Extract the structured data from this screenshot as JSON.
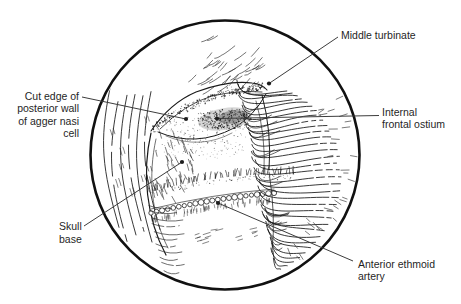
{
  "labels": {
    "middle_turbinate": {
      "lines": [
        "Middle turbinate"
      ]
    },
    "internal_frontal_ostium": {
      "lines": [
        "Internal",
        "frontal ostium"
      ]
    },
    "cut_edge_agger_nasi": {
      "lines": [
        "Cut edge of",
        "posterior wall",
        "of agger nasi",
        "cell"
      ]
    },
    "skull_base": {
      "lines": [
        "Skull",
        "base"
      ]
    },
    "anterior_ethmoid_artery": {
      "lines": [
        "Anterior ethmoid",
        "artery"
      ]
    }
  },
  "colors": {
    "background": "#ffffff",
    "ink": "#1a1a1a",
    "leader_line": "#3c3c3c",
    "label_text": "#1f1f1f"
  }
}
